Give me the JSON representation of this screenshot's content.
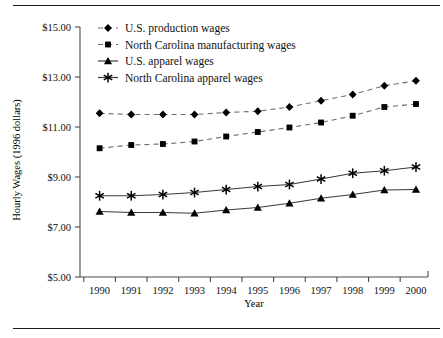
{
  "figure": {
    "has_top_rule": true,
    "has_bottom_rule": true
  },
  "chart_data": {
    "type": "line",
    "title": "",
    "xlabel": "Year",
    "ylabel": "Hourly Wages (1996 dollars)",
    "categories": [
      1990,
      1991,
      1992,
      1993,
      1994,
      1995,
      1996,
      1997,
      1998,
      1999,
      2000
    ],
    "x": [
      "1990",
      "1991",
      "1992",
      "1993",
      "1994",
      "1995",
      "1996",
      "1997",
      "1998",
      "1999",
      "2000"
    ],
    "xtick_labels": [
      "1990",
      "1991",
      "1992",
      "1993",
      "1994",
      "1995",
      "1996",
      "1997",
      "1998",
      "1999",
      "2000"
    ],
    "ytick_labels": [
      "$5.00",
      "$7.00",
      "$9.00",
      "$11.00",
      "$13.00",
      "$15.00"
    ],
    "ytick_values": [
      5,
      7,
      9,
      11,
      13,
      15
    ],
    "ylim": [
      5,
      15
    ],
    "grid": false,
    "legend_position": "upper-left-inside",
    "series": [
      {
        "name": "U.S. production wages",
        "marker": "diamond",
        "linestyle": "dashed",
        "values": [
          11.55,
          11.5,
          11.5,
          11.5,
          11.58,
          11.63,
          11.8,
          12.05,
          12.3,
          12.65,
          12.85
        ]
      },
      {
        "name": "North Carolina manufacturing wages",
        "marker": "square",
        "linestyle": "dashed",
        "values": [
          10.15,
          10.28,
          10.32,
          10.42,
          10.62,
          10.8,
          10.98,
          11.18,
          11.45,
          11.8,
          11.92
        ]
      },
      {
        "name": "U.S. apparel wages",
        "marker": "triangle",
        "linestyle": "solid",
        "values": [
          7.62,
          7.58,
          7.58,
          7.55,
          7.68,
          7.78,
          7.95,
          8.15,
          8.3,
          8.48,
          8.5
        ]
      },
      {
        "name": "North Carolina apparel wages",
        "marker": "asterisk",
        "linestyle": "solid",
        "values": [
          8.25,
          8.25,
          8.3,
          8.38,
          8.5,
          8.62,
          8.7,
          8.92,
          9.15,
          9.25,
          9.4
        ]
      }
    ]
  },
  "legend": {
    "entries": [
      {
        "label": "U.S. production wages",
        "marker": "diamond",
        "linestyle": "dashed"
      },
      {
        "label": "North Carolina manufacturing wages",
        "marker": "square",
        "linestyle": "dashed"
      },
      {
        "label": "U.S. apparel wages",
        "marker": "triangle",
        "linestyle": "solid"
      },
      {
        "label": "North Carolina apparel wages",
        "marker": "asterisk",
        "linestyle": "solid"
      }
    ]
  }
}
